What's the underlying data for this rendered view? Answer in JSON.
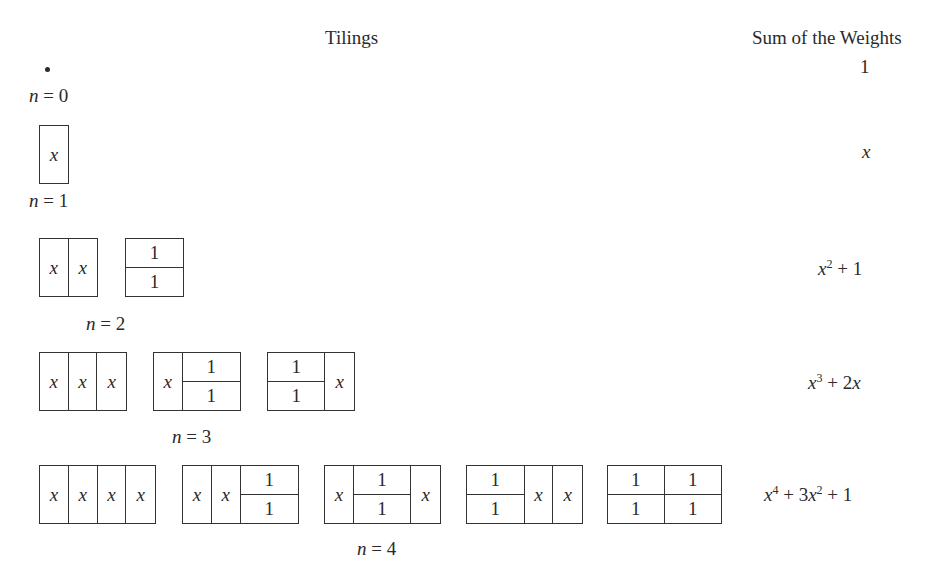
{
  "headers": {
    "tilings": "Tilings",
    "sum": "Sum of the Weights"
  },
  "rows": [
    {
      "n_label": "n = 0",
      "n_var": "n",
      "n_value": "0",
      "sum": "1",
      "sum_parts": [
        {
          "t": "1"
        }
      ],
      "tilings": []
    },
    {
      "n_label": "n = 1",
      "n_var": "n",
      "n_value": "1",
      "sum": "x",
      "tilings": [
        [
          "x"
        ]
      ]
    },
    {
      "n_label": "n = 2",
      "n_var": "n",
      "n_value": "2",
      "sum": "x^2 + 1",
      "tilings": [
        [
          "x",
          "x"
        ],
        [
          "11"
        ]
      ]
    },
    {
      "n_label": "n = 3",
      "n_var": "n",
      "n_value": "3",
      "sum": "x^3 + 2x",
      "tilings": [
        [
          "x",
          "x",
          "x"
        ],
        [
          "x",
          "11"
        ],
        [
          "11",
          "x"
        ]
      ]
    },
    {
      "n_label": "n = 4",
      "n_var": "n",
      "n_value": "4",
      "sum": "x^4 + 3x^2 + 1",
      "tilings": [
        [
          "x",
          "x",
          "x",
          "x"
        ],
        [
          "x",
          "x",
          "11"
        ],
        [
          "x",
          "11",
          "x"
        ],
        [
          "11",
          "x",
          "x"
        ],
        [
          "11",
          "11"
        ]
      ]
    }
  ],
  "cell_labels": {
    "square": "x",
    "domino_top": "1",
    "domino_bottom": "1"
  },
  "sum_display": {
    "r0": {
      "a": "1"
    },
    "r1": {
      "a": "x"
    },
    "r2": {
      "base": "x",
      "exp": "2",
      "rest": " + 1"
    },
    "r3": {
      "base": "x",
      "exp": "3",
      "rest": " + 2",
      "tail": "x"
    },
    "r4": {
      "base": "x",
      "exp": "4",
      "mid": " + 3",
      "base2": "x",
      "exp2": "2",
      "rest": " + 1"
    }
  },
  "labels": {
    "eq": " = ",
    "n": "n",
    "v0": "0",
    "v1": "1",
    "v2": "2",
    "v3": "3",
    "v4": "4"
  },
  "dot": "•"
}
